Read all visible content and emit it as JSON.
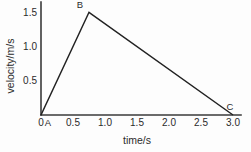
{
  "chart_data": {
    "type": "line",
    "title": "",
    "xlabel": "time/s",
    "ylabel": "velocity/m/s",
    "xlim": [
      0,
      3.0
    ],
    "ylim": [
      0,
      1.65
    ],
    "grid": false,
    "legend": null,
    "xticks": [
      "0",
      "0.5",
      "1.0",
      "1.5",
      "2.0",
      "2.5",
      "3.0"
    ],
    "xtick_values": [
      0,
      0.5,
      1.0,
      1.5,
      2.0,
      2.5,
      3.0
    ],
    "yticks": [
      "0.5",
      "1.0",
      "1.5"
    ],
    "ytick_values": [
      0.5,
      1.0,
      1.5
    ],
    "x": [
      0,
      0.75,
      3.0
    ],
    "values": [
      0,
      1.5,
      0
    ],
    "series": [
      {
        "name": "velocity",
        "points": [
          {
            "label": "A",
            "x": 0,
            "y": 0
          },
          {
            "label": "B",
            "x": 0.75,
            "y": 1.5
          },
          {
            "label": "C",
            "x": 3.0,
            "y": 0
          }
        ]
      }
    ],
    "annotations": [
      {
        "label": "A",
        "x": 0,
        "y": 0
      },
      {
        "label": "B",
        "x": 0.75,
        "y": 1.5
      },
      {
        "label": "C",
        "x": 3.0,
        "y": 0
      }
    ],
    "colors": {
      "line": "#222222",
      "axis": "#3a3a3a",
      "text": "#2b2b2b",
      "background": "#fdfdfd"
    }
  }
}
